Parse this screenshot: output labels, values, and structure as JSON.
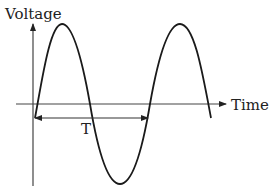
{
  "diagram": {
    "axes": {
      "y_label": "Voltage",
      "x_label": "Time"
    },
    "annotations": {
      "period_label": "T"
    },
    "colors": {
      "curve": "#1a1a1a",
      "axis": "#333333",
      "text": "#222222",
      "background": "#ffffff"
    },
    "waveform": {
      "type": "sine",
      "cycles_shown": 1.6,
      "period_marker": "one full period from origin to second zero-crossing going up"
    }
  }
}
